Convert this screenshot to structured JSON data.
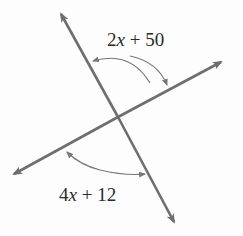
{
  "diagram": {
    "type": "intersecting-lines",
    "line_color": "#6e6e6e",
    "arc_color": "#777777",
    "angles": [
      {
        "id": "top",
        "label_coef": "2",
        "label_var": "x",
        "label_rest": " + 50",
        "label": "2x + 50"
      },
      {
        "id": "bottom",
        "label_coef": "4",
        "label_var": "x",
        "label_rest": " + 12",
        "label": "4x + 12"
      }
    ]
  }
}
